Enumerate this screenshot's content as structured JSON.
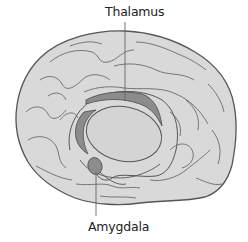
{
  "diagram": {
    "labels": {
      "thalamus": "Thalamus",
      "amygdala": "Amygdala"
    },
    "colors": {
      "background": "#ffffff",
      "cortex_fill": "#d9d9d9",
      "outline": "#555555",
      "sulci": "#6a6a6a",
      "highlight_structure": "#8c8c8c",
      "inner_region": "#d4d4d4",
      "leader_line": "#666666",
      "label_text": "#222222"
    }
  }
}
